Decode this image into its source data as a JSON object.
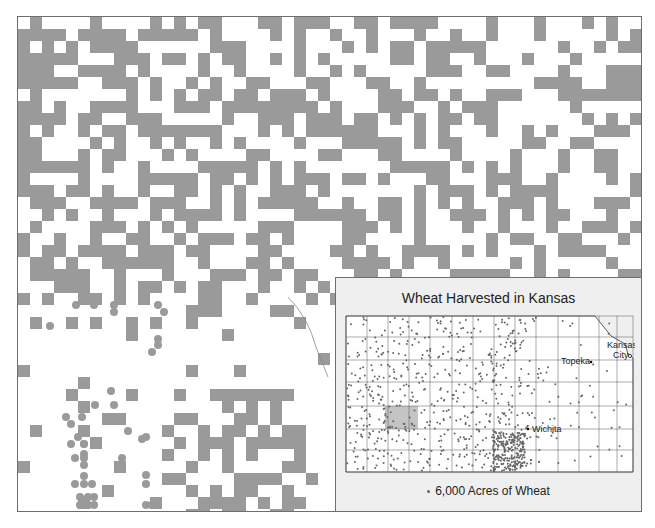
{
  "aerial_map": {
    "description": "Aerial view of crop field patterns (dark gray blocks are wheat fields, circles are center-pivot fields)",
    "field_color": "#9a9a9a",
    "background_color": "#ffffff",
    "border_color": "#6e6e6e"
  },
  "inset": {
    "title": "Wheat Harvested in Kansas",
    "background_color": "#efefef",
    "highlighted_county_color": "#c4c4c4",
    "dot_color": "#666666",
    "cities": [
      {
        "name": "Topeka",
        "label": "Topeka"
      },
      {
        "name": "Kansas City",
        "label_line1": "Kansas",
        "label_line2": "City"
      },
      {
        "name": "Wichita",
        "label": "Wichita"
      }
    ],
    "legend": {
      "symbol": "dot",
      "label": "6,000 Acres of Wheat"
    }
  }
}
